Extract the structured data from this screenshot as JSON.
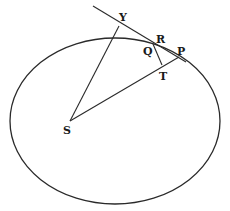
{
  "diagram": {
    "type": "geometric-figure",
    "stroke_color": "#2a2a2a",
    "background": "#ffffff",
    "labels": {
      "Y": "Y",
      "R": "R",
      "Q": "Q",
      "P": "P",
      "T": "T",
      "S": "S"
    },
    "ellipse": {
      "cx": 115,
      "cy": 121,
      "rx": 105,
      "ry": 83
    },
    "points": {
      "S": [
        70,
        121
      ],
      "Y": [
        119,
        23
      ],
      "P": [
        179,
        57
      ],
      "Q": [
        153,
        44
      ],
      "T": [
        162,
        65
      ],
      "tangent_start": [
        93,
        6
      ],
      "tangent_end": [
        186,
        62
      ]
    },
    "segments": [
      {
        "name": "tangent-line",
        "from": "tangent_start",
        "to": "tangent_end"
      },
      {
        "name": "SY",
        "from": "S",
        "to": "Y"
      },
      {
        "name": "SP",
        "from": "S",
        "to": "P"
      },
      {
        "name": "QT",
        "from": "Q",
        "to": "T"
      }
    ]
  }
}
